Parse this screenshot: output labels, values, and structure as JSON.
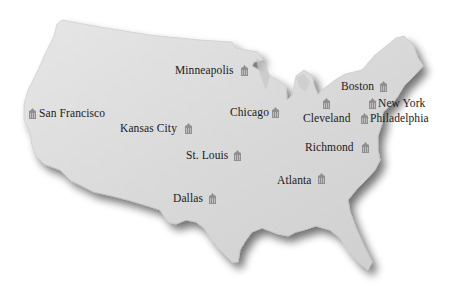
{
  "map": {
    "subject": "United States (contiguous) silhouette",
    "fill_color": "#d9d9d9",
    "shadow_color": "#9a9a9a",
    "icon": "bank-building-icon",
    "icon_color": "#8f8f8f"
  },
  "cities": [
    {
      "id": "minneapolis",
      "label": "Minneapolis",
      "icon_side": "right"
    },
    {
      "id": "san-francisco",
      "label": "San Francisco",
      "icon_side": "left"
    },
    {
      "id": "kansas-city",
      "label": "Kansas City",
      "icon_side": "right"
    },
    {
      "id": "chicago",
      "label": "Chicago",
      "icon_side": "right"
    },
    {
      "id": "cleveland",
      "label": "Cleveland",
      "icon_side": "above-right"
    },
    {
      "id": "boston",
      "label": "Boston",
      "icon_side": "right"
    },
    {
      "id": "new-york",
      "label": "New York",
      "icon_side": "left"
    },
    {
      "id": "philadelphia",
      "label": "Philadelphia",
      "icon_side": "left"
    },
    {
      "id": "richmond",
      "label": "Richmond",
      "icon_side": "right"
    },
    {
      "id": "st-louis",
      "label": "St. Louis",
      "icon_side": "right"
    },
    {
      "id": "atlanta",
      "label": "Atlanta",
      "icon_side": "right"
    },
    {
      "id": "dallas",
      "label": "Dallas",
      "icon_side": "right"
    }
  ]
}
